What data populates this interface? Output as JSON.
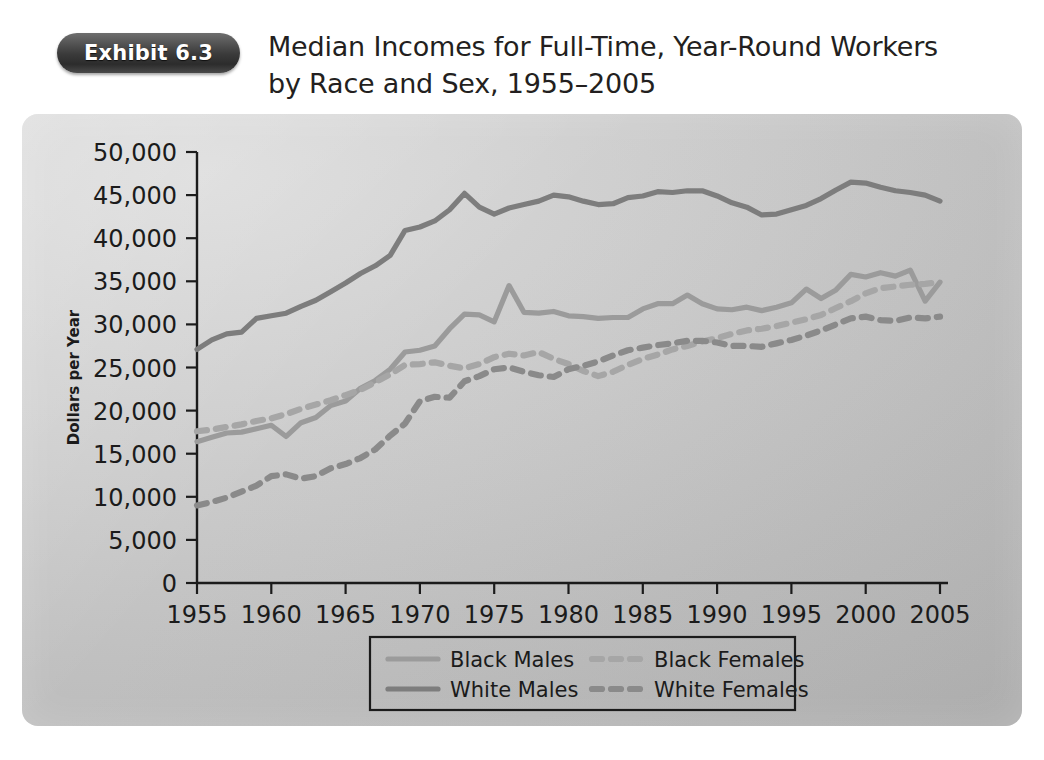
{
  "exhibit": {
    "badge_label": "Exhibit 6.3",
    "title": "Median Incomes for Full-Time, Year-Round Workers by Race and Sex, 1955–2005"
  },
  "colors": {
    "panel_background": "#c6c6c6",
    "badge_background": "#333333",
    "black_males": "#9b9b9b",
    "white_males": "#7d7d7d",
    "black_females": "#a6a6a6",
    "white_females": "#8a8a8a",
    "axis": "#1b1b1b",
    "text": "#231f20"
  },
  "chart_data": {
    "type": "line",
    "title": "Median Incomes for Full-Time, Year-Round Workers by Race and Sex, 1955–2005",
    "xlabel": "",
    "ylabel": "Dollars per Year",
    "xlim": [
      1955,
      2005
    ],
    "ylim": [
      0,
      50000
    ],
    "grid": false,
    "legend_position": "bottom",
    "ytick_labels": [
      "0",
      "5,000",
      "10,000",
      "15,000",
      "20,000",
      "25,000",
      "30,000",
      "35,000",
      "40,000",
      "45,000",
      "50,000"
    ],
    "ytick_values": [
      0,
      5000,
      10000,
      15000,
      20000,
      25000,
      30000,
      35000,
      40000,
      45000,
      50000
    ],
    "xtick_labels": [
      "1955",
      "1960",
      "1965",
      "1970",
      "1975",
      "1980",
      "1985",
      "1990",
      "1995",
      "2000",
      "2005"
    ],
    "xtick_values": [
      1955,
      1960,
      1965,
      1970,
      1975,
      1980,
      1985,
      1990,
      1995,
      2000,
      2005
    ],
    "x": [
      1955,
      1956,
      1957,
      1958,
      1959,
      1960,
      1961,
      1962,
      1963,
      1964,
      1965,
      1966,
      1967,
      1968,
      1969,
      1970,
      1971,
      1972,
      1973,
      1974,
      1975,
      1976,
      1977,
      1978,
      1979,
      1980,
      1981,
      1982,
      1983,
      1984,
      1985,
      1986,
      1987,
      1988,
      1989,
      1990,
      1991,
      1992,
      1993,
      1994,
      1995,
      1996,
      1997,
      1998,
      1999,
      2000,
      2001,
      2002,
      2003,
      2004,
      2005
    ],
    "series": [
      {
        "name": "White Males",
        "style": "solid",
        "color": "#7d7d7d",
        "values": [
          27100,
          28200,
          28900,
          29100,
          30700,
          31000,
          31300,
          32100,
          32800,
          33800,
          34800,
          35900,
          36800,
          38000,
          40900,
          41300,
          42000,
          43300,
          45200,
          43600,
          42800,
          43500,
          43900,
          44300,
          45000,
          44800,
          44300,
          43900,
          44000,
          44700,
          44900,
          45400,
          45300,
          45500,
          45500,
          44900,
          44100,
          43600,
          42700,
          42800,
          43300,
          43800,
          44600,
          45600,
          46500,
          46400,
          45900,
          45500,
          45300,
          45000,
          44300
        ]
      },
      {
        "name": "Black Males",
        "style": "solid",
        "color": "#9b9b9b",
        "values": [
          16400,
          16900,
          17400,
          17500,
          17900,
          18300,
          17000,
          18600,
          19200,
          20600,
          21100,
          22600,
          23500,
          24800,
          26800,
          27000,
          27500,
          29500,
          31200,
          31100,
          30300,
          34500,
          31400,
          31300,
          31500,
          31000,
          30900,
          30700,
          30800,
          30800,
          31800,
          32400,
          32400,
          33400,
          32400,
          31800,
          31700,
          32000,
          31600,
          32000,
          32500,
          34100,
          33000,
          34000,
          35800,
          35500,
          36000,
          35600,
          36300,
          32700,
          34900
        ]
      },
      {
        "name": "Black Females",
        "style": "dashed",
        "color": "#a6a6a6",
        "values": [
          17600,
          17800,
          18100,
          18400,
          18800,
          19100,
          19600,
          20200,
          20700,
          21200,
          21800,
          22400,
          23300,
          24200,
          25300,
          25400,
          25600,
          25200,
          24900,
          25400,
          26200,
          26600,
          26400,
          26800,
          26000,
          25400,
          24600,
          24000,
          24500,
          25300,
          26000,
          26500,
          27100,
          27500,
          28000,
          28400,
          28900,
          29300,
          29500,
          29800,
          30200,
          30600,
          31100,
          31900,
          32700,
          33600,
          34200,
          34400,
          34600,
          34700,
          34900
        ]
      },
      {
        "name": "White Females",
        "style": "dashed",
        "color": "#8a8a8a",
        "values": [
          9000,
          9400,
          9900,
          10600,
          11300,
          12400,
          12600,
          12100,
          12400,
          13300,
          13800,
          14500,
          15500,
          17100,
          18500,
          21100,
          21600,
          21500,
          23400,
          24000,
          24800,
          25000,
          24500,
          24100,
          23900,
          24800,
          25200,
          25700,
          26400,
          27000,
          27300,
          27600,
          27800,
          28100,
          28100,
          27900,
          27500,
          27500,
          27400,
          27800,
          28200,
          28700,
          29300,
          30000,
          30700,
          30900,
          30500,
          30400,
          30800,
          30700,
          30900
        ]
      }
    ]
  },
  "legend": {
    "entries": [
      {
        "label": "Black Males",
        "style": "solid",
        "color": "#9b9b9b"
      },
      {
        "label": "Black Females",
        "style": "dashed",
        "color": "#a6a6a6"
      },
      {
        "label": "White Males",
        "style": "solid",
        "color": "#7d7d7d"
      },
      {
        "label": "White Females",
        "style": "dashed",
        "color": "#8a8a8a"
      }
    ]
  }
}
